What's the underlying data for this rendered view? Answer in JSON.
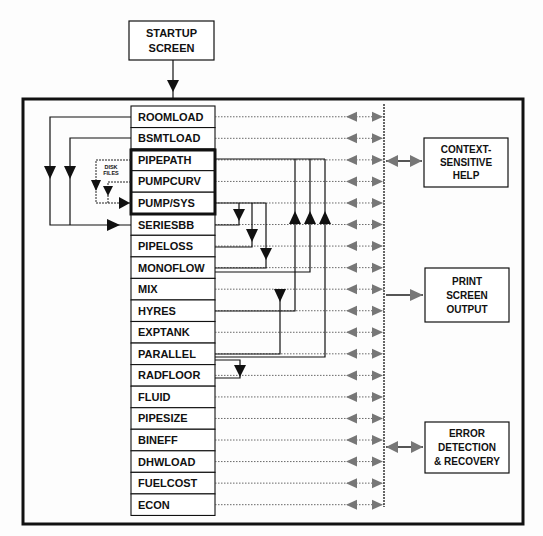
{
  "startup": {
    "line1": "STARTUP",
    "line2": "SCREEN"
  },
  "modules": [
    {
      "label": "ROOMLOAD"
    },
    {
      "label": "BSMTLOAD"
    },
    {
      "label": "PIPEPATH"
    },
    {
      "label": "PUMPCURV"
    },
    {
      "label": "PUMP/SYS"
    },
    {
      "label": "SERIESBB"
    },
    {
      "label": "PIPELOSS"
    },
    {
      "label": "MONOFLOW"
    },
    {
      "label": "MIX"
    },
    {
      "label": "HYRES"
    },
    {
      "label": "EXPTANK"
    },
    {
      "label": "PARALLEL"
    },
    {
      "label": "RADFLOOR"
    },
    {
      "label": "FLUID"
    },
    {
      "label": "PIPESIZE"
    },
    {
      "label": "BINEFF"
    },
    {
      "label": "DHWLOAD"
    },
    {
      "label": "FUELCOST"
    },
    {
      "label": "ECON"
    }
  ],
  "disk_files": {
    "line1": "DISK",
    "line2": "FILES"
  },
  "side_boxes": {
    "help": {
      "line1": "CONTEXT-",
      "line2": "SENSITIVE",
      "line3": "HELP"
    },
    "print": {
      "line1": "PRINT",
      "line2": "SCREEN",
      "line3": "OUTPUT"
    },
    "error": {
      "line1": "ERROR",
      "line2": "DETECTION",
      "line3": "& RECOVERY"
    }
  },
  "colors": {
    "line": "#111111",
    "arrow_gray": "#777777",
    "background": "#fdfdfd"
  }
}
